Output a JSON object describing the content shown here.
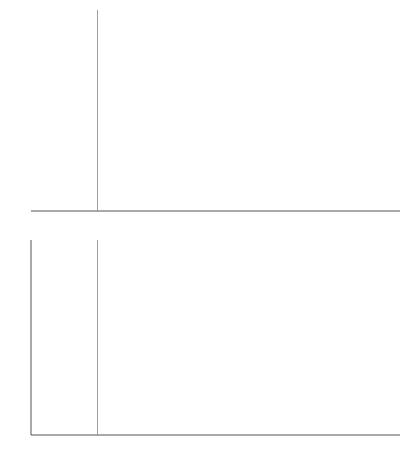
{
  "chart_data": [
    {
      "type": "line",
      "title": "",
      "xlabel": "ϵ",
      "ylabel": "",
      "xlim": [
        -3.2,
        2.0
      ],
      "ylim": [
        0,
        0.43
      ],
      "grid": false,
      "y_ticks_shown": false,
      "x_ticks": [
        -3,
        -2,
        -1,
        0,
        1
      ],
      "x_tick_labels": [
        "−3",
        "−2",
        "−1",
        "0",
        "1"
      ],
      "vertical_line": {
        "x": -2.33,
        "label": "k"
      },
      "x": [
        -3.2,
        -3.0,
        -2.8,
        -2.6,
        -2.4,
        -2.2,
        -2.0,
        -1.8,
        -1.6,
        -1.4,
        -1.2,
        -1.0,
        -0.8,
        -0.6,
        -0.4,
        -0.2,
        0.0,
        0.2,
        0.4,
        0.6,
        0.8,
        1.0,
        1.2,
        1.4,
        1.6,
        1.8,
        2.0
      ],
      "series": [
        {
          "name": "conditional",
          "style": "dashed",
          "label": "conditional",
          "values": [
            0.02,
            0.034,
            0.054,
            0.08,
            0.114,
            0.152,
            0.194,
            0.237,
            0.3,
            0.372,
            0.413,
            0.43,
            0.426,
            0.402,
            0.361,
            0.306,
            0.245,
            0.185,
            0.131,
            0.088,
            0.055,
            0.032,
            0.018,
            0.009,
            0.004,
            0.002,
            0.001
          ]
        },
        {
          "name": "unconditional",
          "style": "solid",
          "label": "unconditional",
          "values": [
            0.002,
            0.004,
            0.008,
            0.014,
            0.022,
            0.036,
            0.054,
            0.079,
            0.111,
            0.15,
            0.194,
            0.242,
            0.29,
            0.333,
            0.368,
            0.391,
            0.399,
            0.391,
            0.368,
            0.333,
            0.29,
            0.242,
            0.194,
            0.15,
            0.111,
            0.079,
            0.054
          ]
        }
      ]
    },
    {
      "type": "line",
      "title": "",
      "xlabel": "ϵ",
      "ylabel": "",
      "xlim": [
        -3.2,
        2.0
      ],
      "ylim": [
        0,
        1.0
      ],
      "grid": false,
      "x_ticks": [
        -3,
        -2,
        -1,
        0,
        1
      ],
      "x_tick_labels": [
        "−3",
        "−2",
        "−1",
        "0",
        "1"
      ],
      "y_ticks": [
        0.0,
        0.2,
        0.4,
        0.6,
        0.8,
        1.0
      ],
      "y_tick_labels": [
        "0.0",
        "0.2",
        "0.4",
        "0.6",
        "0.8",
        "1.0"
      ],
      "vertical_line": {
        "x": -2.33,
        "label": "k"
      },
      "x": [
        -3.2,
        -3.0,
        -2.8,
        -2.6,
        -2.4,
        -2.2,
        -2.0,
        -1.8,
        -1.6,
        -1.4,
        -1.2,
        -1.0,
        -0.8,
        -0.6,
        -0.4,
        -0.2,
        0.0,
        0.2,
        0.4,
        0.6,
        0.8,
        1.0,
        1.2,
        1.4,
        1.6,
        1.8,
        2.0
      ],
      "series": [
        {
          "name": "conditional",
          "style": "dashed",
          "label": "conditional",
          "values": [
            0.004,
            0.012,
            0.021,
            0.034,
            0.053,
            0.079,
            0.123,
            0.18,
            0.25,
            0.34,
            0.43,
            0.52,
            0.6,
            0.68,
            0.75,
            0.81,
            0.86,
            0.9,
            0.93,
            0.955,
            0.97,
            0.98,
            0.988,
            0.993,
            0.996,
            0.998,
            0.999
          ]
        },
        {
          "name": "unconditional",
          "style": "solid",
          "label": "unconditional",
          "values": [
            0.001,
            0.001,
            0.003,
            0.005,
            0.008,
            0.014,
            0.023,
            0.036,
            0.055,
            0.081,
            0.115,
            0.159,
            0.212,
            0.274,
            0.345,
            0.421,
            0.5,
            0.579,
            0.655,
            0.726,
            0.788,
            0.841,
            0.885,
            0.919,
            0.945,
            0.964,
            0.977
          ]
        }
      ]
    }
  ],
  "labels": {
    "top": {
      "k": "k",
      "conditional": "conditional",
      "unconditional": "unconditional",
      "epsilon": "ϵ"
    },
    "bottom": {
      "k": "k",
      "conditional": "conditional",
      "unconditional": "unconditional",
      "epsilon": "ϵ"
    }
  }
}
